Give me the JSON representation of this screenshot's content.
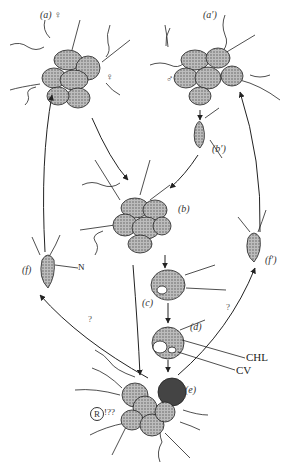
{
  "diagram": {
    "type": "life-cycle",
    "stages": [
      {
        "id": "a",
        "label": "(a) ♀",
        "sex_symbol_extra": "♀",
        "description": "female colony"
      },
      {
        "id": "a_prime",
        "label": "(a′)",
        "sex_symbol_extra": "♂",
        "description": "male colony"
      },
      {
        "id": "b_prime",
        "label": "(b′)"
      },
      {
        "id": "b",
        "label": "(b)"
      },
      {
        "id": "c",
        "label": "(c)"
      },
      {
        "id": "d",
        "label": "(d)"
      },
      {
        "id": "e",
        "label": "(e)"
      },
      {
        "id": "f",
        "label": "(f)"
      },
      {
        "id": "f_prime",
        "label": "(f′)"
      }
    ],
    "annotations": {
      "N": "N",
      "CHL": "CHL",
      "CV": "CV",
      "R": "R",
      "R_suffix": "!??",
      "q_left": "?",
      "q_right": "?"
    },
    "edges": [
      {
        "from": "a",
        "to": "b"
      },
      {
        "from": "a_prime",
        "to": "b_prime"
      },
      {
        "from": "b_prime",
        "to": "b"
      },
      {
        "from": "b",
        "to": "c"
      },
      {
        "from": "c",
        "to": "d"
      },
      {
        "from": "d",
        "to": "e"
      },
      {
        "from": "b",
        "to": "e"
      },
      {
        "from": "e",
        "to": "f",
        "uncertain": true
      },
      {
        "from": "e",
        "to": "f_prime",
        "uncertain": true
      },
      {
        "from": "f",
        "to": "a"
      },
      {
        "from": "f_prime",
        "to": "a_prime"
      }
    ]
  }
}
